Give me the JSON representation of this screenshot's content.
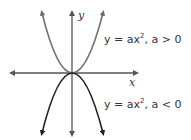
{
  "diagram": {
    "axes": {
      "x_label": "x",
      "y_label": "y"
    },
    "curves": [
      {
        "label_main": "y = ax",
        "exp": "2",
        "condition": ", a > 0",
        "color": "#707070",
        "direction": "opens-up"
      },
      {
        "label_main": "y = ax",
        "exp": "2",
        "condition": ", a < 0",
        "color": "#222222",
        "direction": "opens-down"
      }
    ]
  }
}
